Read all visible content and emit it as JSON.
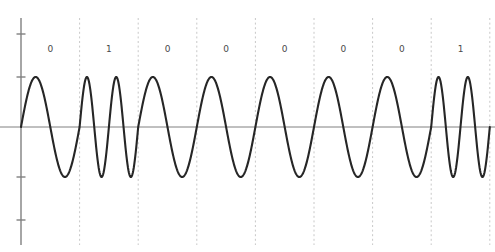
{
  "figure": {
    "name": "fsk-waveform",
    "background_color": "#ffffff",
    "waveform_color": "#262626",
    "axis_color": "#808080",
    "gridline_color": "#c8c8c8",
    "label_color": "#4a4a4a"
  },
  "axis": {
    "name": "y-axis",
    "x": 21,
    "top": 18,
    "bottom": 245,
    "baseline_y": 127,
    "ticks": [
      34,
      77,
      177,
      220
    ],
    "tick_length": 9
  },
  "plot": {
    "x_start": 21,
    "x_end": 490,
    "bit_width": 58.6,
    "amplitude": 50,
    "samples_per_bit": 120
  },
  "chart_data": {
    "type": "line",
    "title": "",
    "subtitle": "",
    "xlabel": "",
    "ylabel": "",
    "grid": true,
    "legend": null,
    "xlim": [
      0,
      8
    ],
    "ylim": [
      -1.35,
      1.35
    ],
    "modulation": "FSK",
    "bit_labels": [
      "0",
      "1",
      "0",
      "0",
      "0",
      "0",
      "0",
      "1"
    ],
    "bits": [
      0,
      1,
      0,
      0,
      0,
      0,
      0,
      1
    ],
    "cycles_per_bit": {
      "0": 1,
      "1": 2
    },
    "series": [
      {
        "name": "fsk-carrier",
        "color": "#262626",
        "amplitude": 1.0,
        "cycles": [
          1,
          2,
          1,
          1,
          1,
          1,
          1,
          2
        ]
      }
    ],
    "gridlines_x": [
      1,
      2,
      3,
      4,
      5,
      6,
      7,
      8
    ],
    "yticks": [
      -1.0,
      -0.5,
      0.5,
      1.0
    ]
  }
}
